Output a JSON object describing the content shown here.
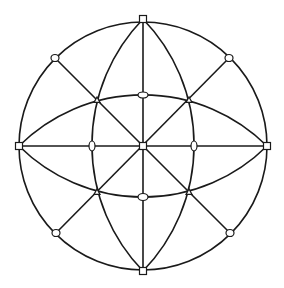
{
  "diagram": {
    "type": "geometric-graph",
    "colors": {
      "stroke": "#1a1a1a",
      "node_fill": "#ffffff",
      "background": "#ffffff"
    },
    "circle": {
      "cx": 143,
      "cy": 146,
      "r": 124
    },
    "lens_vertical": {
      "top": [
        143,
        19
      ],
      "bottom": [
        143,
        271
      ],
      "radius": 181
    },
    "lens_horizontal": {
      "left": [
        19,
        146
      ],
      "right": [
        267,
        146
      ],
      "radius": 176
    },
    "square_nodes": [
      {
        "id": "top",
        "x": 143,
        "y": 19
      },
      {
        "id": "bottom",
        "x": 143,
        "y": 271
      },
      {
        "id": "left",
        "x": 19,
        "y": 146
      },
      {
        "id": "right",
        "x": 267,
        "y": 146
      },
      {
        "id": "center",
        "x": 143,
        "y": 146
      }
    ],
    "ellipse_nodes": [
      {
        "id": "inner-top",
        "x": 143,
        "y": 95,
        "rx": 5,
        "ry": 3
      },
      {
        "id": "inner-bottom",
        "x": 143,
        "y": 197,
        "rx": 5,
        "ry": 3.5
      },
      {
        "id": "inner-left",
        "x": 92,
        "y": 146,
        "rx": 3,
        "ry": 5
      },
      {
        "id": "inner-right",
        "x": 194,
        "y": 146,
        "rx": 3,
        "ry": 5
      },
      {
        "id": "outer-nw",
        "x": 55,
        "y": 58,
        "rx": 4,
        "ry": 3.5
      },
      {
        "id": "outer-ne",
        "x": 229,
        "y": 58,
        "rx": 4,
        "ry": 3.5
      },
      {
        "id": "outer-sw",
        "x": 56,
        "y": 233,
        "rx": 4,
        "ry": 3.5
      },
      {
        "id": "outer-se",
        "x": 230,
        "y": 233,
        "rx": 4,
        "ry": 3.5
      }
    ],
    "triangle_nodes": [
      {
        "id": "cross-nw",
        "x": 97,
        "y": 100
      },
      {
        "id": "cross-ne",
        "x": 189,
        "y": 100
      },
      {
        "id": "cross-sw",
        "x": 97,
        "y": 192
      },
      {
        "id": "cross-se",
        "x": 189,
        "y": 192
      }
    ]
  }
}
